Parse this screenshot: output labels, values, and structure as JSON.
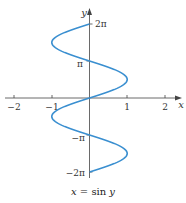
{
  "chart_data": {
    "type": "line",
    "title": "x = sin y",
    "xlabel": "x",
    "ylabel": "y",
    "xlim": [
      -2,
      2
    ],
    "ylim": [
      -6.2832,
      6.2832
    ],
    "x_ticks": [
      -2,
      -1,
      1,
      2
    ],
    "x_tick_labels": [
      "−2",
      "−1",
      "1",
      "2"
    ],
    "y_ticks": [
      -6.2832,
      -3.1416,
      3.1416,
      6.2832
    ],
    "y_tick_labels": [
      "−2π",
      "−π",
      "π",
      "2π"
    ],
    "grid": false,
    "legend": null,
    "series": [
      {
        "name": "x = sin y",
        "color": "#3a8fd0",
        "parametric": "x = sin(y), y in [-2π, 2π]",
        "points": [
          {
            "x": 0,
            "y": -6.2832
          },
          {
            "x": 1,
            "y": -4.7124
          },
          {
            "x": 0,
            "y": -3.1416
          },
          {
            "x": -1,
            "y": -1.5708
          },
          {
            "x": 0,
            "y": 0
          },
          {
            "x": 1,
            "y": 1.5708
          },
          {
            "x": 0,
            "y": 3.1416
          },
          {
            "x": -1,
            "y": 4.7124
          },
          {
            "x": 0,
            "y": 6.2832
          }
        ]
      }
    ]
  },
  "caption": {
    "lhs": "x",
    "eq": " = sin ",
    "rhs": "y"
  }
}
